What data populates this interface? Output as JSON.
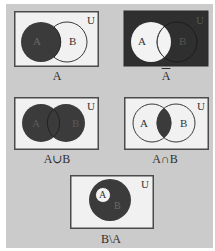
{
  "figure": {
    "universe_label": "U",
    "set_a_label": "A",
    "set_b_label": "B",
    "colors": {
      "background": "#cbcbcb",
      "box_fill": "#f1f1f1",
      "shaded": "#3b3b3b",
      "outline": "#3a3a3a",
      "label_on_light": "#333333",
      "label_on_dark": "#6a6a6a"
    },
    "panels": [
      {
        "id": "a",
        "caption": "A",
        "shaded_region": "A"
      },
      {
        "id": "complement-a",
        "caption": "A",
        "caption_overline": true,
        "shaded_region": "U \\ A"
      },
      {
        "id": "union",
        "caption": "A∪B",
        "shaded_region": "A ∪ B"
      },
      {
        "id": "intersection",
        "caption": "A∩B",
        "shaded_region": "A ∩ B"
      },
      {
        "id": "difference",
        "caption": "B\\A",
        "shaded_region": "B \\ A"
      }
    ]
  }
}
